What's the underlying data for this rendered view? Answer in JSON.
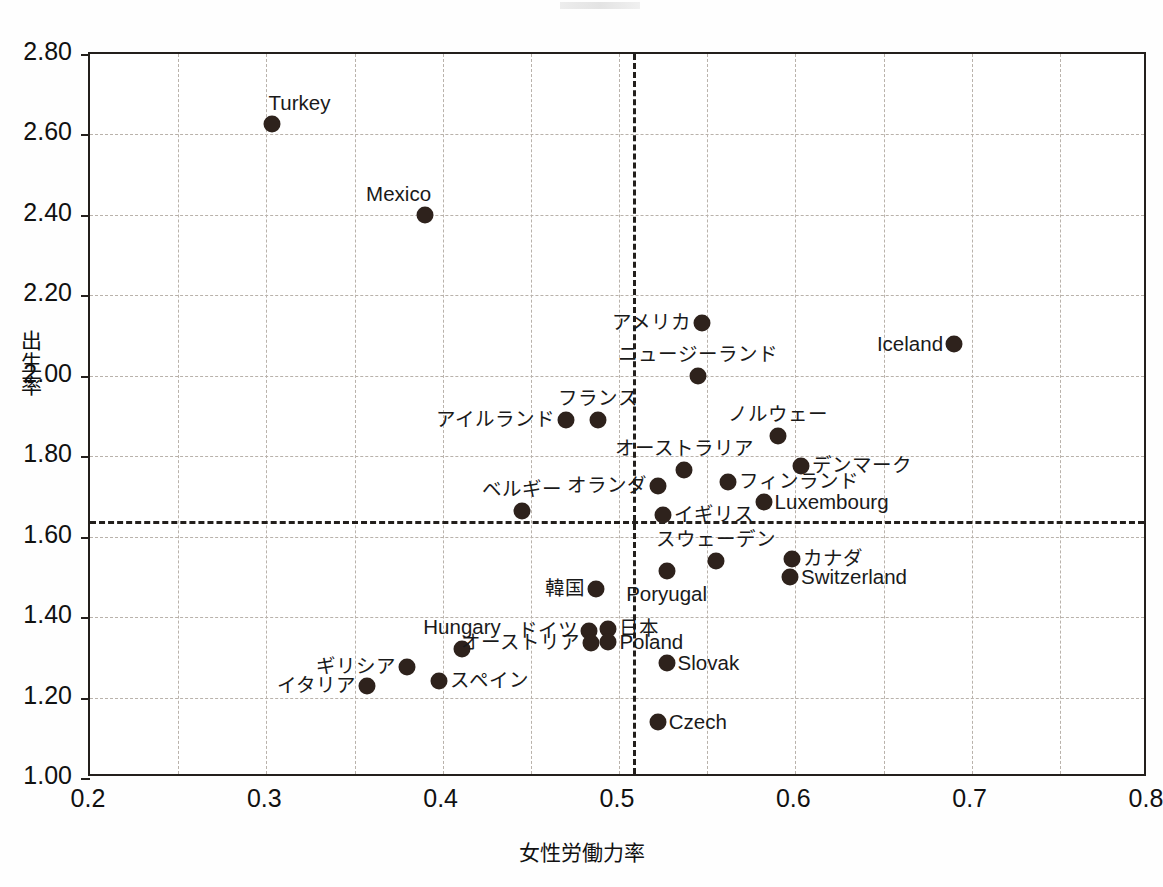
{
  "chart_data": {
    "type": "scatter",
    "title": "",
    "xlabel": "女性労働力率",
    "ylabel": "出生率",
    "xlim": [
      0.2,
      0.8
    ],
    "ylim": [
      1.0,
      2.8
    ],
    "xticks": [
      "0.2",
      "0.3",
      "0.4",
      "0.5",
      "0.6",
      "0.7",
      "0.8"
    ],
    "yticks": [
      "1.00",
      "1.20",
      "1.40",
      "1.60",
      "1.80",
      "2.00",
      "2.20",
      "2.40",
      "2.60",
      "2.80"
    ],
    "grid": true,
    "legend": "none",
    "reference_lines": {
      "horizontal_y": 1.64,
      "vertical_x": 0.508
    },
    "point_color": "#2e221c",
    "points": [
      {
        "label": "Turkey",
        "x": 0.303,
        "y": 2.625,
        "lpos": "above-right"
      },
      {
        "label": "Mexico",
        "x": 0.39,
        "y": 2.4,
        "lpos": "above-left"
      },
      {
        "label": "アメリカ",
        "x": 0.547,
        "y": 2.13,
        "lpos": "left"
      },
      {
        "label": "Iceland",
        "x": 0.69,
        "y": 2.08,
        "lpos": "left"
      },
      {
        "label": "ニュージーランド",
        "x": 0.545,
        "y": 2.0,
        "lpos": "above"
      },
      {
        "label": "フランス",
        "x": 0.488,
        "y": 1.89,
        "lpos": "above"
      },
      {
        "label": "アイルランド",
        "x": 0.47,
        "y": 1.89,
        "lpos": "left"
      },
      {
        "label": "ノルウェー",
        "x": 0.59,
        "y": 1.85,
        "lpos": "above"
      },
      {
        "label": "デンマーク",
        "x": 0.603,
        "y": 1.775,
        "lpos": "right"
      },
      {
        "label": "オーストラリア",
        "x": 0.537,
        "y": 1.765,
        "lpos": "above"
      },
      {
        "label": "フィンランド",
        "x": 0.562,
        "y": 1.735,
        "lpos": "right"
      },
      {
        "label": "オランダ",
        "x": 0.522,
        "y": 1.725,
        "lpos": "left"
      },
      {
        "label": "Luxembourg",
        "x": 0.582,
        "y": 1.685,
        "lpos": "right"
      },
      {
        "label": "ベルギー",
        "x": 0.445,
        "y": 1.665,
        "lpos": "above"
      },
      {
        "label": "イギリス",
        "x": 0.525,
        "y": 1.655,
        "lpos": "right"
      },
      {
        "label": "カナダ",
        "x": 0.598,
        "y": 1.545,
        "lpos": "right"
      },
      {
        "label": "スウェーデン",
        "x": 0.555,
        "y": 1.54,
        "lpos": "above"
      },
      {
        "label": "Switzerland",
        "x": 0.597,
        "y": 1.5,
        "lpos": "right"
      },
      {
        "label": "Poryugal",
        "x": 0.527,
        "y": 1.515,
        "lpos": "below"
      },
      {
        "label": "韓国",
        "x": 0.487,
        "y": 1.47,
        "lpos": "left"
      },
      {
        "label": "ドイツ",
        "x": 0.483,
        "y": 1.365,
        "lpos": "left"
      },
      {
        "label": "日本",
        "x": 0.494,
        "y": 1.37,
        "lpos": "right"
      },
      {
        "label": "オーストリア",
        "x": 0.484,
        "y": 1.335,
        "lpos": "left"
      },
      {
        "label": "Poland",
        "x": 0.494,
        "y": 1.338,
        "lpos": "right"
      },
      {
        "label": "Hungary",
        "x": 0.411,
        "y": 1.32,
        "lpos": "above"
      },
      {
        "label": "Slovak",
        "x": 0.527,
        "y": 1.287,
        "lpos": "right"
      },
      {
        "label": "ギリシア",
        "x": 0.38,
        "y": 1.277,
        "lpos": "left"
      },
      {
        "label": "スペイン",
        "x": 0.398,
        "y": 1.24,
        "lpos": "right"
      },
      {
        "label": "イタリア",
        "x": 0.357,
        "y": 1.228,
        "lpos": "left"
      },
      {
        "label": "Czech",
        "x": 0.522,
        "y": 1.14,
        "lpos": "right"
      }
    ]
  }
}
